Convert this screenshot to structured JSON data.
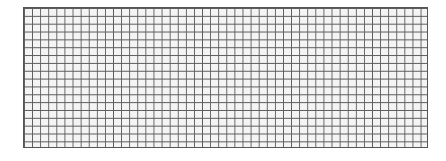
{
  "grid": {
    "columns": 50,
    "rows": 18,
    "line_color": "#5a5a5a",
    "cell_color": "#f4f4f4"
  }
}
